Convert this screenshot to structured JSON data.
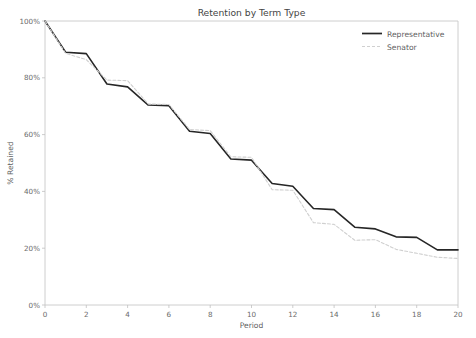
{
  "chart_data": {
    "type": "line",
    "title": "Retention by Term Type",
    "xlabel": "Period",
    "ylabel": "% Retained",
    "xlim": [
      0,
      20
    ],
    "ylim": [
      0,
      100
    ],
    "grid": false,
    "legend_position": "top-right",
    "xticks": [
      0,
      2,
      4,
      6,
      8,
      10,
      12,
      14,
      16,
      18,
      20
    ],
    "xtick_labels": [
      "0",
      "2",
      "4",
      "6",
      "8",
      "10",
      "12",
      "14",
      "16",
      "18",
      "20"
    ],
    "yticks": [
      0,
      20,
      40,
      60,
      80,
      100
    ],
    "ytick_labels": [
      "0%",
      "20%",
      "40%",
      "60%",
      "80%",
      "100%"
    ],
    "x": [
      0,
      1,
      2,
      3,
      4,
      5,
      6,
      7,
      8,
      9,
      10,
      11,
      12,
      13,
      14,
      15,
      16,
      17,
      18,
      19,
      20
    ],
    "series": [
      {
        "name": "Representative",
        "color": "#262626",
        "style": "solid",
        "linewidth": 1.6,
        "values": [
          100,
          89.0,
          88.5,
          77.8,
          76.8,
          70.4,
          70.2,
          61.2,
          60.4,
          51.4,
          51.0,
          42.8,
          41.8,
          34.0,
          33.6,
          27.4,
          26.8,
          24.0,
          23.8,
          19.4,
          19.4
        ]
      },
      {
        "name": "Senator",
        "color": "#d0d0d0",
        "style": "dashed",
        "linewidth": 1.1,
        "values": [
          100,
          88.6,
          86.4,
          79.2,
          79.0,
          70.8,
          70.6,
          61.8,
          61.4,
          52.2,
          52.0,
          40.6,
          40.4,
          29.0,
          28.4,
          22.8,
          23.0,
          19.6,
          18.2,
          16.8,
          16.4
        ]
      }
    ]
  },
  "legend": {
    "items": [
      {
        "label": "Representative"
      },
      {
        "label": "Senator"
      }
    ]
  }
}
